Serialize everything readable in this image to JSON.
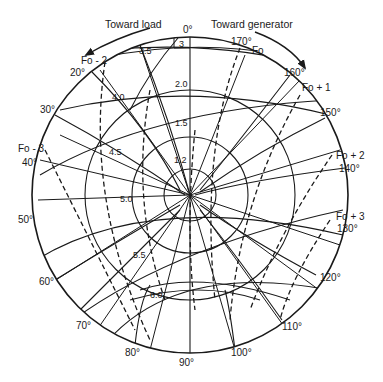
{
  "diagram": {
    "type": "polar-chart",
    "arrows": {
      "left": {
        "label": "Toward load"
      },
      "right": {
        "label": "Toward generator"
      }
    },
    "angle_labels": [
      {
        "label": "0°"
      },
      {
        "label": "170°"
      },
      {
        "label": "160°"
      },
      {
        "label": "150°"
      },
      {
        "label": "140°"
      },
      {
        "label": "130°"
      },
      {
        "label": "120°"
      },
      {
        "label": "110°"
      },
      {
        "label": "100°"
      },
      {
        "label": "90°"
      },
      {
        "label": "80°"
      },
      {
        "label": "70°"
      },
      {
        "label": "60°"
      },
      {
        "label": "50°"
      },
      {
        "label": "40°"
      },
      {
        "label": "30°"
      },
      {
        "label": "20°"
      }
    ],
    "frequency_labels": [
      {
        "label": "Fo"
      },
      {
        "label": "Fo + 1"
      },
      {
        "label": "Fo + 2"
      },
      {
        "label": "Fo + 3"
      },
      {
        "label": "Fo - 2"
      },
      {
        "label": "Fo - 3"
      }
    ],
    "ratio_labels": [
      {
        "label": "3"
      },
      {
        "label": "3.5"
      },
      {
        "label": "2.0"
      },
      {
        "label": "4.0"
      },
      {
        "label": "1.5"
      },
      {
        "label": "4.5"
      },
      {
        "label": "1.2"
      },
      {
        "label": "5.0"
      },
      {
        "label": "5.5"
      },
      {
        "label": "6.0"
      }
    ]
  }
}
